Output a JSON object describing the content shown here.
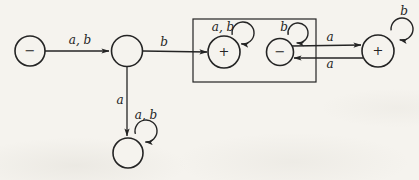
{
  "figure": {
    "background": "#f5f3ee",
    "ink": "#242424",
    "states": [
      {
        "id": "s0",
        "sign": "−",
        "x": 30,
        "y": 51,
        "r": 15
      },
      {
        "id": "s1",
        "sign": "",
        "x": 127,
        "y": 51,
        "r": 15.5
      },
      {
        "id": "s2",
        "sign": "+",
        "x": 224,
        "y": 52,
        "r": 16
      },
      {
        "id": "s3",
        "sign": "−",
        "x": 280,
        "y": 52,
        "r": 13.5
      },
      {
        "id": "s4",
        "sign": "+",
        "x": 378,
        "y": 51,
        "r": 16
      },
      {
        "id": "s5",
        "sign": "",
        "x": 128,
        "y": 153,
        "r": 15
      }
    ],
    "subset_box": {
      "x": 193,
      "y": 19,
      "width": 123,
      "height": 63
    },
    "edges": [
      {
        "id": "s0-s1",
        "from": "s0",
        "to": "s1",
        "on": "a, b",
        "x1": 45,
        "y1": 51,
        "x2": 109,
        "y2": 51,
        "label_x": 80,
        "label_y": 44
      },
      {
        "id": "s1-s2",
        "from": "s1",
        "to": "s2",
        "on": "b",
        "x1": 143,
        "y1": 51,
        "x2": 207,
        "y2": 52,
        "label_x": 164,
        "label_y": 46
      },
      {
        "id": "s1-s5",
        "from": "s1",
        "to": "s5",
        "on": "a",
        "x1": 127,
        "y1": 67,
        "x2": 127,
        "y2": 136,
        "label_x": 120,
        "label_y": 104
      },
      {
        "id": "s3-s4",
        "from": "s3",
        "to": "s4",
        "on": "a",
        "x1": 292,
        "y1": 46,
        "x2": 361,
        "y2": 45,
        "label_x": 330,
        "label_y": 41
      },
      {
        "id": "s4-s3",
        "from": "s4",
        "to": "s3",
        "on": "a",
        "x1": 363,
        "y1": 58,
        "x2": 294,
        "y2": 58,
        "label_x": 330,
        "label_y": 68
      }
    ],
    "loops": [
      {
        "id": "s2-s2",
        "state": "s2",
        "on": "a, b",
        "cx": 243,
        "cy": 33,
        "r": 11,
        "label_x": 223,
        "label_y": 31
      },
      {
        "id": "s3-s3",
        "state": "s3",
        "on": "b",
        "cx": 298,
        "cy": 33,
        "r": 10,
        "label_x": 284,
        "label_y": 31
      },
      {
        "id": "s4-s4",
        "state": "s4",
        "on": "b",
        "cx": 402,
        "cy": 29,
        "r": 11,
        "label_x": 404,
        "label_y": 15
      },
      {
        "id": "s5-s5",
        "state": "s5",
        "on": "a, b",
        "cx": 146,
        "cy": 131,
        "r": 11,
        "label_x": 146,
        "label_y": 119
      }
    ]
  }
}
